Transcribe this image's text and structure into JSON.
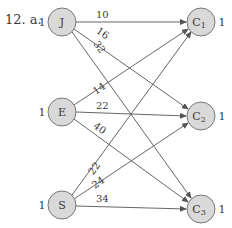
{
  "problem_label": "12. a.",
  "colors": {
    "node_fill": "#d9d9d9",
    "node_stroke": "#777777",
    "edge": "#555555",
    "text": "#3a3a3a"
  },
  "sources": [
    {
      "id": "J",
      "label": "J",
      "supply": "1"
    },
    {
      "id": "E",
      "label": "E",
      "supply": "1"
    },
    {
      "id": "S",
      "label": "S",
      "supply": "1"
    }
  ],
  "sinks": [
    {
      "id": "C1",
      "label": "C",
      "sub": "1",
      "demand": "1"
    },
    {
      "id": "C2",
      "label": "C",
      "sub": "2",
      "demand": "1"
    },
    {
      "id": "C3",
      "label": "C",
      "sub": "3",
      "demand": "1"
    }
  ],
  "edges": [
    {
      "from": "J",
      "to": "C1",
      "weight": "10"
    },
    {
      "from": "J",
      "to": "C2",
      "weight": "16"
    },
    {
      "from": "J",
      "to": "C3",
      "weight": "32"
    },
    {
      "from": "E",
      "to": "C1",
      "weight": "14"
    },
    {
      "from": "E",
      "to": "C2",
      "weight": "22"
    },
    {
      "from": "E",
      "to": "C3",
      "weight": "40"
    },
    {
      "from": "S",
      "to": "C1",
      "weight": "22"
    },
    {
      "from": "S",
      "to": "C2",
      "weight": "24"
    },
    {
      "from": "S",
      "to": "C3",
      "weight": "34"
    }
  ]
}
